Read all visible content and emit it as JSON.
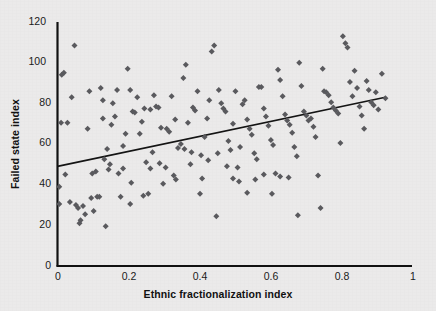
{
  "figure": {
    "background_color": "#ebeaea",
    "axis_color": "#111111",
    "marker_color": "#5a5a5e",
    "trendline_color": "#141414"
  },
  "axes": {
    "x_title": "Ethnic fractionalization index",
    "y_title": "Failed state index",
    "x_ticks": [
      "0",
      "0.2",
      "0.4",
      "0.6",
      "0.8",
      "1"
    ],
    "y_ticks": [
      "0",
      "20",
      "40",
      "60",
      "80",
      "100",
      "120"
    ]
  },
  "chart_data": {
    "type": "scatter",
    "title": "",
    "xlabel": "Ethnic fractionalization index",
    "ylabel": "Failed state index",
    "xlim": [
      0,
      1
    ],
    "ylim": [
      0,
      120
    ],
    "xticks": [
      0,
      0.2,
      0.4,
      0.6,
      0.8,
      1
    ],
    "yticks": [
      0,
      20,
      40,
      60,
      80,
      100,
      120
    ],
    "grid": false,
    "legend": false,
    "marker": "diamond",
    "marker_color": "#5a5a5e",
    "trendline": {
      "type": "linear",
      "x_start": 0.0,
      "y_start": 49.0,
      "x_end": 0.925,
      "y_end": 83.0,
      "slope": 36.8,
      "intercept": 49.0,
      "color": "#141414"
    },
    "points": [
      [
        0.005,
        39.0
      ],
      [
        0.005,
        30.5
      ],
      [
        0.01,
        70.5
      ],
      [
        0.012,
        94.0
      ],
      [
        0.018,
        95.0
      ],
      [
        0.022,
        45.0
      ],
      [
        0.028,
        70.5
      ],
      [
        0.035,
        31.5
      ],
      [
        0.04,
        83.0
      ],
      [
        0.048,
        108.5
      ],
      [
        0.052,
        30.0
      ],
      [
        0.058,
        28.5
      ],
      [
        0.062,
        21.0
      ],
      [
        0.065,
        22.5
      ],
      [
        0.072,
        29.5
      ],
      [
        0.078,
        25.5
      ],
      [
        0.085,
        67.5
      ],
      [
        0.09,
        86.0
      ],
      [
        0.095,
        33.5
      ],
      [
        0.098,
        45.5
      ],
      [
        0.102,
        27.0
      ],
      [
        0.108,
        46.5
      ],
      [
        0.112,
        34.0
      ],
      [
        0.118,
        34.0
      ],
      [
        0.122,
        87.5
      ],
      [
        0.128,
        72.5
      ],
      [
        0.132,
        52.5
      ],
      [
        0.136,
        19.5
      ],
      [
        0.14,
        57.5
      ],
      [
        0.144,
        47.5
      ],
      [
        0.148,
        50.0
      ],
      [
        0.152,
        69.5
      ],
      [
        0.156,
        80.0
      ],
      [
        0.162,
        73.5
      ],
      [
        0.168,
        86.5
      ],
      [
        0.172,
        45.5
      ],
      [
        0.178,
        34.0
      ],
      [
        0.185,
        59.0
      ],
      [
        0.192,
        65.0
      ],
      [
        0.198,
        97.0
      ],
      [
        0.205,
        86.5
      ],
      [
        0.208,
        41.0
      ],
      [
        0.212,
        76.0
      ],
      [
        0.218,
        75.5
      ],
      [
        0.225,
        83.0
      ],
      [
        0.232,
        65.0
      ],
      [
        0.238,
        71.0
      ],
      [
        0.242,
        34.5
      ],
      [
        0.25,
        51.0
      ],
      [
        0.256,
        35.5
      ],
      [
        0.262,
        48.0
      ],
      [
        0.268,
        56.0
      ],
      [
        0.272,
        84.0
      ],
      [
        0.278,
        78.5
      ],
      [
        0.285,
        78.0
      ],
      [
        0.292,
        68.0
      ],
      [
        0.298,
        40.5
      ],
      [
        0.308,
        67.5
      ],
      [
        0.315,
        66.0
      ],
      [
        0.322,
        83.5
      ],
      [
        0.328,
        44.5
      ],
      [
        0.334,
        42.5
      ],
      [
        0.34,
        58.0
      ],
      [
        0.348,
        60.0
      ],
      [
        0.355,
        92.5
      ],
      [
        0.362,
        99.0
      ],
      [
        0.368,
        70.5
      ],
      [
        0.375,
        50.0
      ],
      [
        0.382,
        78.0
      ],
      [
        0.388,
        76.5
      ],
      [
        0.395,
        86.0
      ],
      [
        0.402,
        35.5
      ],
      [
        0.408,
        43.0
      ],
      [
        0.415,
        63.5
      ],
      [
        0.422,
        72.5
      ],
      [
        0.428,
        81.5
      ],
      [
        0.435,
        105.5
      ],
      [
        0.442,
        108.5
      ],
      [
        0.448,
        24.5
      ],
      [
        0.455,
        86.5
      ],
      [
        0.462,
        80.0
      ],
      [
        0.468,
        77.5
      ],
      [
        0.474,
        76.0
      ],
      [
        0.482,
        61.5
      ],
      [
        0.488,
        57.0
      ],
      [
        0.495,
        70.0
      ],
      [
        0.502,
        86.0
      ],
      [
        0.508,
        48.5
      ],
      [
        0.515,
        58.5
      ],
      [
        0.522,
        79.5
      ],
      [
        0.528,
        81.5
      ],
      [
        0.535,
        72.0
      ],
      [
        0.542,
        67.5
      ],
      [
        0.548,
        64.5
      ],
      [
        0.555,
        55.5
      ],
      [
        0.562,
        52.5
      ],
      [
        0.568,
        88.0
      ],
      [
        0.575,
        88.0
      ],
      [
        0.582,
        77.5
      ],
      [
        0.588,
        73.5
      ],
      [
        0.595,
        69.0
      ],
      [
        0.602,
        62.0
      ],
      [
        0.608,
        59.5
      ],
      [
        0.615,
        45.5
      ],
      [
        0.622,
        96.5
      ],
      [
        0.628,
        91.5
      ],
      [
        0.635,
        83.5
      ],
      [
        0.642,
        74.5
      ],
      [
        0.648,
        71.5
      ],
      [
        0.655,
        69.5
      ],
      [
        0.662,
        65.5
      ],
      [
        0.668,
        58.5
      ],
      [
        0.675,
        54.0
      ],
      [
        0.682,
        100.0
      ],
      [
        0.688,
        88.5
      ],
      [
        0.695,
        76.0
      ],
      [
        0.702,
        74.0
      ],
      [
        0.708,
        71.5
      ],
      [
        0.715,
        72.5
      ],
      [
        0.722,
        68.5
      ],
      [
        0.728,
        63.5
      ],
      [
        0.735,
        44.5
      ],
      [
        0.742,
        28.5
      ],
      [
        0.748,
        97.0
      ],
      [
        0.752,
        86.0
      ],
      [
        0.758,
        85.5
      ],
      [
        0.765,
        84.0
      ],
      [
        0.772,
        80.5
      ],
      [
        0.778,
        78.0
      ],
      [
        0.785,
        76.5
      ],
      [
        0.792,
        75.0
      ],
      [
        0.798,
        60.5
      ],
      [
        0.805,
        113.0
      ],
      [
        0.812,
        109.5
      ],
      [
        0.818,
        107.5
      ],
      [
        0.825,
        90.5
      ],
      [
        0.832,
        83.5
      ],
      [
        0.838,
        96.0
      ],
      [
        0.845,
        87.5
      ],
      [
        0.852,
        78.5
      ],
      [
        0.858,
        74.0
      ],
      [
        0.865,
        67.5
      ],
      [
        0.872,
        91.0
      ],
      [
        0.878,
        86.5
      ],
      [
        0.885,
        80.5
      ],
      [
        0.892,
        79.0
      ],
      [
        0.898,
        85.5
      ],
      [
        0.905,
        77.0
      ],
      [
        0.915,
        94.5
      ],
      [
        0.925,
        82.5
      ],
      [
        0.128,
        81.5
      ],
      [
        0.185,
        48.0
      ],
      [
        0.205,
        30.5
      ],
      [
        0.245,
        77.5
      ],
      [
        0.262,
        77.0
      ],
      [
        0.288,
        50.5
      ],
      [
        0.305,
        48.5
      ],
      [
        0.332,
        72.0
      ],
      [
        0.358,
        57.5
      ],
      [
        0.378,
        56.0
      ],
      [
        0.405,
        54.5
      ],
      [
        0.425,
        52.0
      ],
      [
        0.452,
        55.5
      ],
      [
        0.478,
        49.0
      ],
      [
        0.495,
        43.0
      ],
      [
        0.512,
        41.5
      ],
      [
        0.535,
        36.0
      ],
      [
        0.558,
        42.5
      ],
      [
        0.582,
        45.0
      ],
      [
        0.605,
        35.5
      ],
      [
        0.628,
        44.0
      ],
      [
        0.652,
        43.5
      ],
      [
        0.678,
        25.0
      ]
    ]
  }
}
